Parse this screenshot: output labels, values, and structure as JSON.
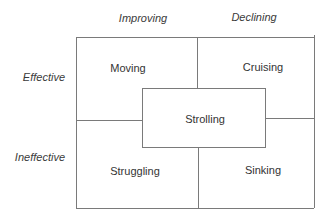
{
  "diagram": {
    "column_headers": [
      {
        "label": "Improving"
      },
      {
        "label": "Declining"
      }
    ],
    "row_headers": [
      {
        "label": "Effective"
      },
      {
        "label": "Ineffective"
      }
    ],
    "quadrants": {
      "top_left": {
        "label": "Moving"
      },
      "top_right": {
        "label": "Cruising"
      },
      "center": {
        "label": "Strolling"
      },
      "bottom_left": {
        "label": "Struggling"
      },
      "bottom_right": {
        "label": "Sinking"
      }
    },
    "colors": {
      "line": "#7a7a7a",
      "text": "#333333",
      "background": "#ffffff"
    }
  }
}
